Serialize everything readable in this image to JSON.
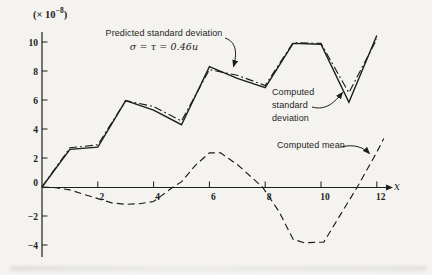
{
  "figure_title": "Nonstationary data analysis figure",
  "chart_data": {
    "type": "line",
    "xlabel": "x",
    "y_scale_label": "(× 10−8)",
    "xlim": [
      0,
      12.6
    ],
    "ylim": [
      -4.6,
      10.8
    ],
    "grid": false,
    "legend_position": "inline-annotations",
    "x_ticks": [
      {
        "v": 2,
        "label": "2"
      },
      {
        "v": 4,
        "label": "4"
      },
      {
        "v": 6,
        "label": "6"
      },
      {
        "v": 8,
        "label": "8"
      },
      {
        "v": 10,
        "label": "10"
      },
      {
        "v": 12,
        "label": "12"
      }
    ],
    "y_ticks": [
      {
        "v": 10,
        "label": "10"
      },
      {
        "v": 8,
        "label": "8"
      },
      {
        "v": 6,
        "label": "6"
      },
      {
        "v": 4,
        "label": "4"
      },
      {
        "v": 2,
        "label": "2"
      },
      {
        "v": 0,
        "label": "0"
      },
      {
        "v": -2,
        "label": "−2"
      },
      {
        "v": -4,
        "label": "−4"
      }
    ],
    "series": [
      {
        "name": "Predicted standard deviation",
        "style": "dashdot",
        "x": [
          0,
          1,
          2,
          3,
          4,
          5,
          6,
          7,
          8,
          9,
          10,
          11,
          12
        ],
        "y": [
          0,
          2.7,
          2.9,
          5.95,
          5.55,
          4.55,
          8.1,
          7.7,
          7.0,
          9.95,
          9.9,
          6.5,
          10.2
        ]
      },
      {
        "name": "Computed standard deviation",
        "style": "solid",
        "x": [
          0,
          1,
          2,
          3,
          4,
          5,
          6,
          7,
          8,
          9,
          10,
          11,
          12
        ],
        "y": [
          0,
          2.6,
          2.75,
          5.95,
          5.3,
          4.3,
          8.3,
          7.5,
          6.85,
          9.9,
          9.85,
          5.85,
          10.45
        ]
      },
      {
        "name": "Computed mean",
        "style": "dashed",
        "x": [
          0,
          0.5,
          1,
          1.5,
          2,
          2.5,
          3,
          3.5,
          4,
          4.7,
          5,
          5.5,
          6,
          6.4,
          7,
          7.9,
          8.5,
          9,
          9.4,
          10.1,
          10.7,
          11.3,
          12,
          12.25
        ],
        "y": [
          0,
          -0.05,
          -0.2,
          -0.5,
          -0.8,
          -1.1,
          -1.2,
          -1.15,
          -1.0,
          0,
          0.35,
          1.5,
          2.35,
          2.35,
          1.55,
          0,
          -1.7,
          -3.6,
          -3.85,
          -3.8,
          -1.9,
          0,
          2.4,
          3.35
        ]
      }
    ]
  },
  "annotations": {
    "y_scale": {
      "prefix": "(× 10",
      "exponent": "−8",
      "suffix": ")"
    },
    "predicted": {
      "line1": "Predicted standard deviation",
      "formula": "σ = τ = 0.46",
      "formula_var": "u"
    },
    "computed_sd": {
      "line1": "Computed",
      "line2": "standard",
      "line3": "deviation"
    },
    "computed_mean": {
      "label": "Computed mean"
    },
    "x_axis": {
      "label": "x"
    }
  },
  "colors": {
    "ink": "#1d1d1b",
    "paper": "#f4f3f0"
  }
}
